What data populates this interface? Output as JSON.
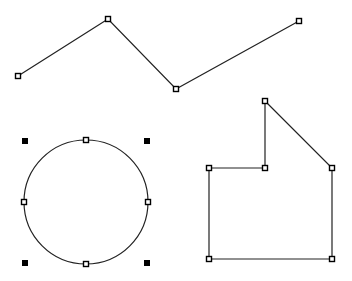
{
  "canvas": {
    "width": 352,
    "height": 281,
    "background": "#ffffff",
    "stroke": "#222222"
  },
  "shapes": {
    "polyline": {
      "points": [
        [
          18,
          76
        ],
        [
          108,
          19
        ],
        [
          176,
          89
        ],
        [
          299,
          21
        ]
      ],
      "handle_size": 5
    },
    "circle": {
      "cx": 86,
      "cy": 202,
      "r": 62,
      "edge_handles": [
        [
          86,
          140
        ],
        [
          24,
          202
        ],
        [
          148,
          202
        ],
        [
          86,
          264
        ]
      ],
      "bbox_handles": [
        [
          25,
          141
        ],
        [
          147,
          141
        ],
        [
          25,
          263
        ],
        [
          147,
          263
        ]
      ]
    },
    "polygon": {
      "points": [
        [
          265,
          101
        ],
        [
          332,
          168
        ],
        [
          332,
          259
        ],
        [
          209,
          259
        ],
        [
          209,
          168
        ],
        [
          265,
          168
        ]
      ]
    }
  }
}
